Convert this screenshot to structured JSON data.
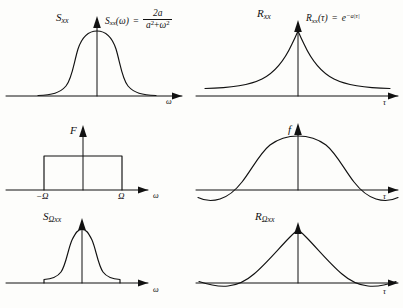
{
  "figure": {
    "background": "#fdfdfb",
    "ink": "#111111",
    "panels": [
      {
        "id": "top-left",
        "row": 1,
        "col": 1,
        "function_label": "S",
        "function_subscript": "xx",
        "axis_label": "ω",
        "curve": "gaussian-bell",
        "equation": {
          "lhs_name": "S",
          "lhs_sub": "xx",
          "lhs_arg": "(ω)",
          "numerator": "2a",
          "denominator_base1": "a",
          "denominator_exp1": "2",
          "denominator_op": "+",
          "denominator_base2": "ω",
          "denominator_exp2": "2"
        }
      },
      {
        "id": "top-right",
        "row": 1,
        "col": 2,
        "function_label": "R",
        "function_subscript": "xx",
        "axis_label": "τ",
        "curve": "two-sided-exponential",
        "equation": {
          "lhs_name": "R",
          "lhs_sub": "xx",
          "lhs_arg": "(τ)",
          "equals": "=",
          "rhs_base": "e",
          "rhs_exponent": "−a|τ|"
        }
      },
      {
        "id": "middle-left",
        "row": 2,
        "col": 1,
        "function_label": "F",
        "function_subscript": "",
        "axis_label": "ω",
        "curve": "rectangle",
        "ticks": [
          {
            "label": "−Ω",
            "position": "left"
          },
          {
            "label": "Ω",
            "position": "right"
          }
        ]
      },
      {
        "id": "middle-right",
        "row": 2,
        "col": 2,
        "function_label": "f",
        "function_subscript": "",
        "axis_label": "τ",
        "curve": "sinc"
      },
      {
        "id": "bottom-left",
        "row": 3,
        "col": 1,
        "function_label": "S",
        "function_subscript": "Ωxx",
        "axis_label": "ω",
        "curve": "band-limited-bell"
      },
      {
        "id": "bottom-right",
        "row": 3,
        "col": 2,
        "function_label": "R",
        "function_subscript": "Ωxx",
        "axis_label": "τ",
        "curve": "exponential-with-ripples"
      }
    ]
  }
}
